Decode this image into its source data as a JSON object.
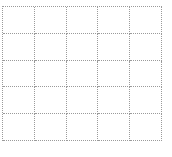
{
  "grid": {
    "rows": 5,
    "columns": 5,
    "line_color": "#9a9a9a",
    "line_style": "dotted",
    "cells": [
      [
        "",
        "",
        "",
        "",
        ""
      ],
      [
        "",
        "",
        "",
        "",
        ""
      ],
      [
        "",
        "",
        "",
        "",
        ""
      ],
      [
        "",
        "",
        "",
        "",
        ""
      ],
      [
        "",
        "",
        "",
        "",
        ""
      ]
    ]
  }
}
